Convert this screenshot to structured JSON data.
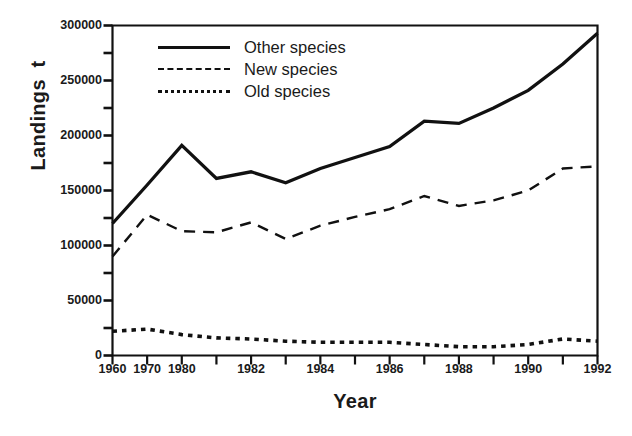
{
  "chart_data": {
    "type": "line",
    "title": "",
    "xlabel": "Year",
    "ylabel": "Landings  t",
    "ylim": [
      0,
      300000
    ],
    "ytick_labels": [
      "0",
      "50000",
      "100000",
      "150000",
      "200000",
      "250000",
      "300000"
    ],
    "ytick_values": [
      0,
      50000,
      100000,
      150000,
      200000,
      250000,
      300000
    ],
    "yminor_values": [
      25000,
      75000,
      125000,
      175000,
      225000,
      275000
    ],
    "grid": false,
    "legend_position": "upper-left-inside",
    "categories": [
      "1960",
      "1970",
      "1980",
      "1981",
      "1982",
      "1983",
      "1984",
      "1985",
      "1986",
      "1987",
      "1988",
      "1989",
      "1990",
      "1991",
      "1992"
    ],
    "xtick_labels": [
      "1960",
      "1970",
      "1980",
      "",
      "1982",
      "",
      "1984",
      "",
      "1986",
      "",
      "1988",
      "",
      "1990",
      "",
      "1992"
    ],
    "series": [
      {
        "name": "Other species",
        "style": "solid",
        "color": "#111111",
        "values": [
          120000,
          155000,
          191000,
          161000,
          167000,
          157000,
          170000,
          180000,
          190000,
          213000,
          211000,
          225000,
          241000,
          265000,
          293000
        ]
      },
      {
        "name": "New species",
        "style": "dashed",
        "color": "#111111",
        "values": [
          90000,
          128000,
          113000,
          112000,
          121000,
          106000,
          118000,
          126000,
          133000,
          145000,
          136000,
          141000,
          150000,
          170000,
          172000
        ]
      },
      {
        "name": "Old species",
        "style": "dotted",
        "color": "#111111",
        "values": [
          22000,
          24000,
          19000,
          16000,
          15000,
          13000,
          12000,
          12000,
          12000,
          10000,
          8000,
          8000,
          10000,
          15000,
          13000
        ]
      }
    ]
  },
  "legend": {
    "items": [
      {
        "label": "Other species",
        "style": "solid"
      },
      {
        "label": "New species",
        "style": "dashed"
      },
      {
        "label": "Old species",
        "style": "dotted"
      }
    ]
  },
  "axes": {
    "y_title": "Landings  t",
    "x_title": "Year"
  }
}
